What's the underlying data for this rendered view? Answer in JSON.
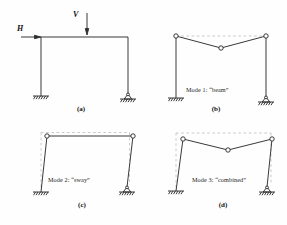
{
  "figure": {
    "colors": {
      "background": "#fefefe",
      "line": "#2f2f2f",
      "dashed": "#bdbdbd"
    },
    "panels": {
      "a": {
        "caption": "(a)",
        "load_h": "H",
        "load_v": "V"
      },
      "b": {
        "caption": "(b)",
        "mode_label": "Mode 1: “beam”"
      },
      "c": {
        "caption": "(c)",
        "mode_label": "Mode 2: “sway”"
      },
      "d": {
        "caption": "(d)",
        "mode_label": "Mode 3: “combined”"
      }
    }
  }
}
